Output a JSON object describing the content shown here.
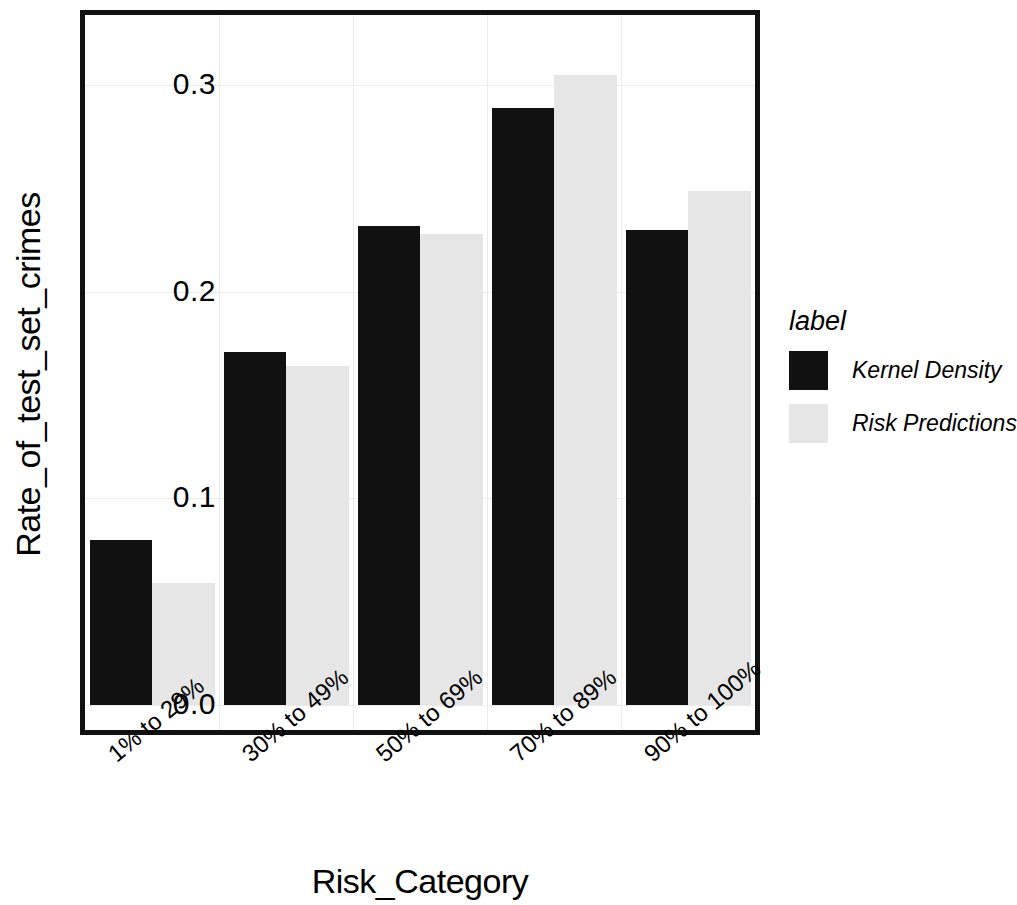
{
  "chart_data": {
    "type": "bar",
    "title": "",
    "xlabel": "Risk_Category",
    "ylabel": "Rate_of_test_set_crimes",
    "categories": [
      "1% to 29%",
      "30% to 49%",
      "50% to 69%",
      "70% to 89%",
      "90% to 100%"
    ],
    "series": [
      {
        "name": "Kernel Density",
        "color": "#111111",
        "values": [
          0.08,
          0.171,
          0.232,
          0.289,
          0.23
        ]
      },
      {
        "name": "Risk Predictions",
        "color": "#e6e6e6",
        "values": [
          0.059,
          0.164,
          0.228,
          0.305,
          0.249
        ]
      }
    ],
    "ylim": [
      0.0,
      0.334
    ],
    "yticks": [
      "0.0",
      "0.1",
      "0.2",
      "0.3"
    ],
    "ytick_values": [
      0.0,
      0.1,
      0.2,
      0.3
    ],
    "grid": true,
    "legend_position": "right",
    "legend_title": "label"
  },
  "axes": {
    "y_title": "Rate_of_test_set_crimes",
    "x_title": "Risk_Category",
    "y_ticks": [
      "0.0",
      "0.1",
      "0.2",
      "0.3"
    ],
    "x_ticks": [
      "1% to 29%",
      "30% to 49%",
      "50% to 69%",
      "70% to 89%",
      "90% to 100%"
    ]
  },
  "legend": {
    "title": "label",
    "entries": [
      {
        "label": "Kernel Density",
        "swatch": "#111111"
      },
      {
        "label": "Risk Predictions",
        "swatch": "#e6e6e6"
      }
    ]
  },
  "colors": {
    "kernel_density": "#111111",
    "risk_predictions": "#e6e6e6",
    "frame": "#111111",
    "grid": "#ececec",
    "background": "#ffffff"
  }
}
